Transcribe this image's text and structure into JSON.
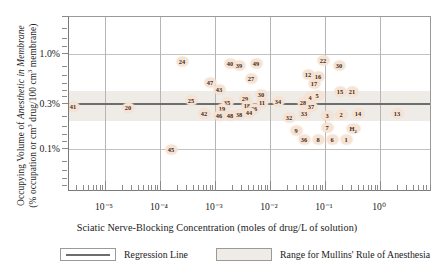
{
  "chart_data": {
    "type": "scatter",
    "title": "",
    "xlabel": "Sciatic Nerve-Blocking Concentration (moles of drug/L of solution)",
    "ylabel_line1": "Occupying Volume of Anesthetic in Membrane",
    "ylabel_line2": "(% occupation or cm3 drug/100 cm3 membrane)",
    "xscale": "log",
    "yscale": "log",
    "xlim": [
      3.16e-06,
      3.16
    ],
    "ylim": [
      0.05,
      2.0
    ],
    "xticks": [
      "10-5",
      "10-4",
      "10-3",
      "10-2",
      "10-1",
      "100"
    ],
    "xtick_labels": [
      "10⁻⁵",
      "10⁻⁴",
      "10⁻³",
      "10⁻²",
      "10⁻¹",
      "10⁰"
    ],
    "yticks": [
      1.0,
      0.3,
      0.1
    ],
    "ytick_labels": [
      "1.0%",
      "0.3%",
      "0.1%"
    ],
    "grid": true,
    "regression_line_y": 0.3,
    "mullins_band": [
      0.22,
      0.42
    ],
    "point_label": "numeric drug index",
    "points": [
      {
        "label": "41",
        "x": 72,
        "y": 105
      },
      {
        "label": "20",
        "x": 127,
        "y": 106
      },
      {
        "label": "24",
        "x": 181,
        "y": 60
      },
      {
        "label": "47",
        "x": 209,
        "y": 81
      },
      {
        "label": "25",
        "x": 190,
        "y": 99
      },
      {
        "label": "42",
        "x": 203,
        "y": 112
      },
      {
        "label": "45",
        "x": 170,
        "y": 148
      },
      {
        "label": "40",
        "x": 229,
        "y": 62
      },
      {
        "label": "39",
        "x": 238,
        "y": 64
      },
      {
        "label": "49",
        "x": 255,
        "y": 62
      },
      {
        "label": "27",
        "x": 250,
        "y": 77
      },
      {
        "label": "43",
        "x": 218,
        "y": 88
      },
      {
        "label": "35",
        "x": 226,
        "y": 101
      },
      {
        "label": "29",
        "x": 244,
        "y": 97
      },
      {
        "label": "18",
        "x": 246,
        "y": 104
      },
      {
        "label": "11",
        "x": 261,
        "y": 101
      },
      {
        "label": "26",
        "x": 253,
        "y": 107
      },
      {
        "label": "30",
        "x": 260,
        "y": 93
      },
      {
        "label": "44",
        "x": 248,
        "y": 111
      },
      {
        "label": "38",
        "x": 238,
        "y": 113
      },
      {
        "label": "19",
        "x": 221,
        "y": 107
      },
      {
        "label": "46",
        "x": 218,
        "y": 114
      },
      {
        "label": "48",
        "x": 229,
        "y": 114
      },
      {
        "label": "34",
        "x": 277,
        "y": 100
      },
      {
        "label": "12",
        "x": 307,
        "y": 73
      },
      {
        "label": "17",
        "x": 313,
        "y": 82
      },
      {
        "label": "22",
        "x": 322,
        "y": 59
      },
      {
        "label": "16",
        "x": 317,
        "y": 75
      },
      {
        "label": "30",
        "x": 338,
        "y": 64
      },
      {
        "label": "28",
        "x": 302,
        "y": 101
      },
      {
        "label": "4",
        "x": 309,
        "y": 96
      },
      {
        "label": "5",
        "x": 316,
        "y": 94
      },
      {
        "label": "37",
        "x": 310,
        "y": 105
      },
      {
        "label": "15",
        "x": 339,
        "y": 90
      },
      {
        "label": "21",
        "x": 351,
        "y": 90
      },
      {
        "label": "33",
        "x": 303,
        "y": 112
      },
      {
        "label": "32",
        "x": 288,
        "y": 116
      },
      {
        "label": "3",
        "x": 326,
        "y": 114
      },
      {
        "label": "2",
        "x": 340,
        "y": 113
      },
      {
        "label": "14",
        "x": 357,
        "y": 112
      },
      {
        "label": "13",
        "x": 396,
        "y": 112
      },
      {
        "label": "9",
        "x": 295,
        "y": 129
      },
      {
        "label": "36",
        "x": 303,
        "y": 138
      },
      {
        "label": "8",
        "x": 317,
        "y": 138
      },
      {
        "label": "7",
        "x": 326,
        "y": 126
      },
      {
        "label": "6",
        "x": 331,
        "y": 138
      },
      {
        "label": "1",
        "x": 345,
        "y": 138
      },
      {
        "label": "H2",
        "x": 352,
        "y": 127
      }
    ]
  },
  "legend": {
    "regression_label": "Regression Line",
    "mullins_label": "Range for Mullins' Rule of Anesthesia"
  },
  "colors": {
    "point_fill": "#f6e3d4",
    "point_text": "#3a2a20",
    "regression": "#6d6d6d",
    "band": "#efece8",
    "grid": "#b5b5b5",
    "frame": "#7a7a7a"
  }
}
